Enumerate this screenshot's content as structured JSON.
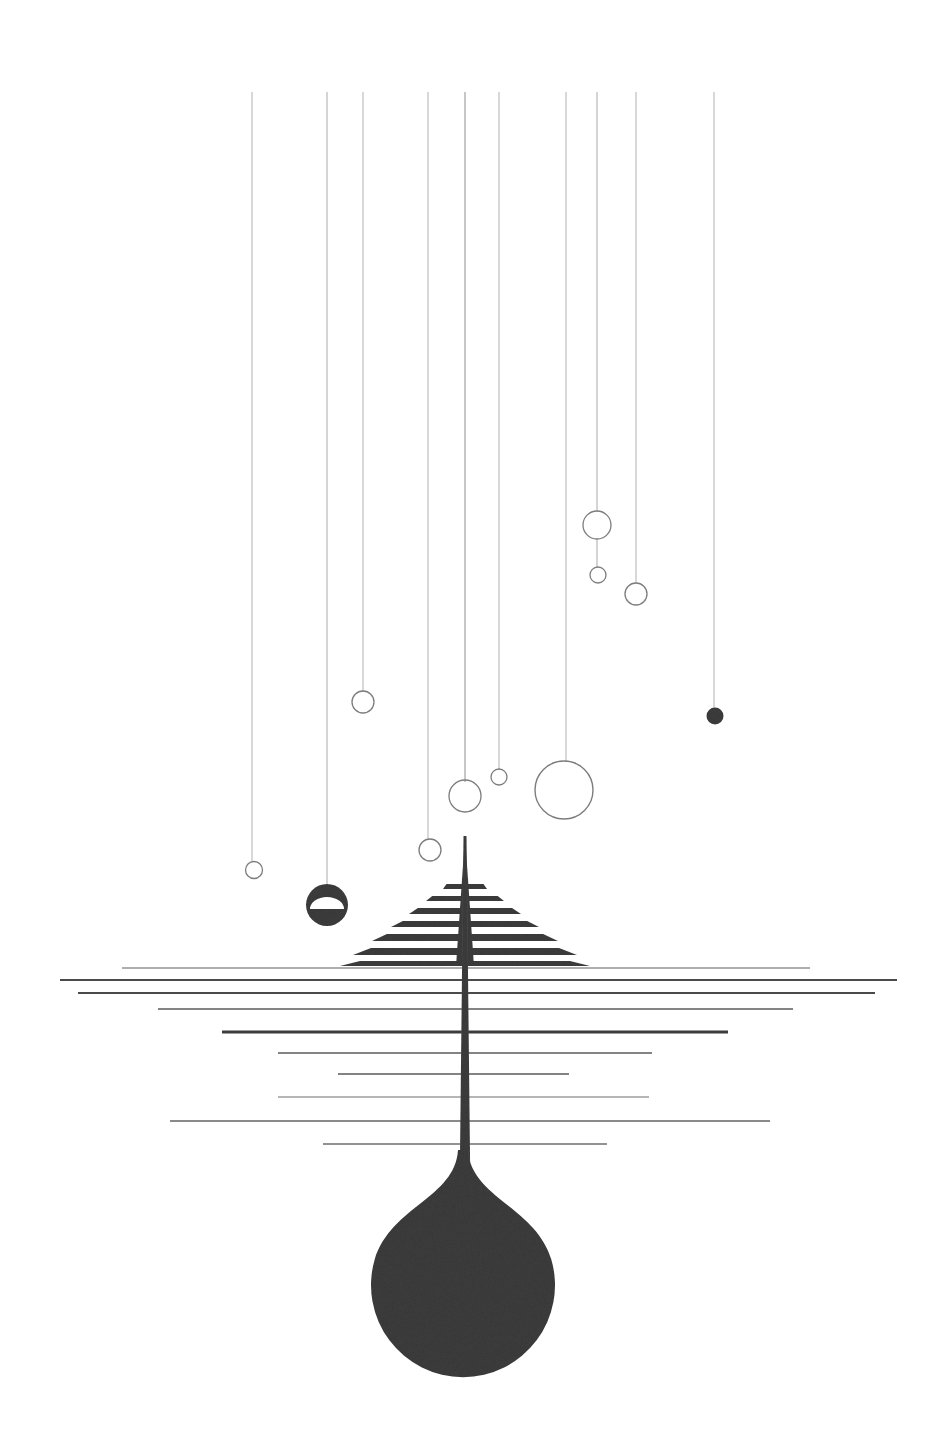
{
  "artwork": {
    "title": "Dandelion Seed / Tree Abstract",
    "canvas": {
      "width": 951,
      "height": 1442,
      "background": "#ffffff"
    },
    "palette": {
      "ink_dark": "#3c3c3c",
      "ink_mid": "#555555",
      "hairline": "#9a9a9a",
      "hairline_faint": "#b4b4b4",
      "background": "#ffffff"
    },
    "caption": "Abstract ink illustration: ten vertical hairlines descend from the top edge, several terminating in small open circles; a striped triangular canopy and a long tapering stem cross a field of horizontal rules and swell into a large filled droplet at the bottom."
  },
  "vertical_threads": [
    {
      "name": "thread-1",
      "x": 252,
      "y_top": 92,
      "y_bottom": 862,
      "width": 0.9,
      "color": "#a8a8a8"
    },
    {
      "name": "thread-2",
      "x": 327,
      "y_top": 92,
      "y_bottom": 884,
      "width": 0.9,
      "color": "#a0a0a0"
    },
    {
      "name": "thread-3",
      "x": 363,
      "y_top": 92,
      "y_bottom": 692,
      "width": 0.9,
      "color": "#a8a8a8"
    },
    {
      "name": "thread-4",
      "x": 428,
      "y_top": 92,
      "y_bottom": 840,
      "width": 0.9,
      "color": "#a8a8a8"
    },
    {
      "name": "thread-5",
      "x": 465,
      "y_top": 92,
      "y_bottom": 782,
      "width": 1.0,
      "color": "#8e8e8e"
    },
    {
      "name": "thread-6",
      "x": 499,
      "y_top": 92,
      "y_bottom": 770,
      "width": 0.9,
      "color": "#a8a8a8"
    },
    {
      "name": "thread-7",
      "x": 566,
      "y_top": 92,
      "y_bottom": 762,
      "width": 0.9,
      "color": "#a8a8a8"
    },
    {
      "name": "thread-8",
      "x": 597,
      "y_top": 92,
      "y_bottom": 512,
      "width": 0.9,
      "color": "#a0a0a0"
    },
    {
      "name": "thread-9",
      "x": 636,
      "y_top": 92,
      "y_bottom": 583,
      "width": 0.9,
      "color": "#a8a8a8"
    },
    {
      "name": "thread-10",
      "x": 714,
      "y_top": 92,
      "y_bottom": 709,
      "width": 0.9,
      "color": "#a8a8a8"
    }
  ],
  "thread_links": [
    {
      "name": "link-8-mid",
      "x": 597,
      "y_top": 539,
      "y_bottom": 567,
      "color": "#a0a0a0"
    }
  ],
  "open_circles": [
    {
      "name": "circle-upper-right-large",
      "cx": 597,
      "cy": 525,
      "r": 14.0,
      "stroke": "#7d7d7d",
      "stroke_width": 1.3
    },
    {
      "name": "circle-upper-right-tiny",
      "cx": 598,
      "cy": 575,
      "r": 8.0,
      "stroke": "#7d7d7d",
      "stroke_width": 1.3
    },
    {
      "name": "circle-upper-far-right",
      "cx": 636,
      "cy": 594,
      "r": 11.0,
      "stroke": "#7d7d7d",
      "stroke_width": 1.3
    },
    {
      "name": "circle-mid-left",
      "cx": 363,
      "cy": 702,
      "r": 11.0,
      "stroke": "#7d7d7d",
      "stroke_width": 1.3
    },
    {
      "name": "circle-center-medium",
      "cx": 465,
      "cy": 796,
      "r": 16.0,
      "stroke": "#7d7d7d",
      "stroke_width": 1.3
    },
    {
      "name": "circle-center-tiny",
      "cx": 499,
      "cy": 777,
      "r": 8.0,
      "stroke": "#7d7d7d",
      "stroke_width": 1.3
    },
    {
      "name": "circle-center-largest",
      "cx": 564,
      "cy": 790,
      "r": 29.0,
      "stroke": "#7d7d7d",
      "stroke_width": 1.4
    },
    {
      "name": "circle-lower-center",
      "cx": 430,
      "cy": 850,
      "r": 11.0,
      "stroke": "#7d7d7d",
      "stroke_width": 1.3
    },
    {
      "name": "circle-lower-left-small",
      "cx": 254,
      "cy": 870,
      "r": 8.5,
      "stroke": "#7d7d7d",
      "stroke_width": 1.3
    }
  ],
  "filled_circles": [
    {
      "name": "dot-far-right-filled",
      "cx": 715,
      "cy": 716,
      "r": 8.5,
      "fill": "#3c3c3c"
    },
    {
      "name": "ball-half-filled",
      "cx": 327,
      "cy": 905,
      "r": 21.0,
      "fill": "#3c3c3c",
      "notch": {
        "cy_offset": 4,
        "rx": 17,
        "ry": 12
      }
    }
  ],
  "canopy": {
    "name": "striped-triangular-canopy",
    "apex_x": 465,
    "apex_y": 836,
    "base_y": 966,
    "fill": "#3c3c3c",
    "bars": [
      {
        "y": 884,
        "half_width": 22,
        "height": 5
      },
      {
        "y": 896,
        "half_width": 39,
        "height": 5
      },
      {
        "y": 908,
        "half_width": 56,
        "height": 6
      },
      {
        "y": 921,
        "half_width": 74,
        "height": 6
      },
      {
        "y": 934,
        "half_width": 93,
        "height": 7
      },
      {
        "y": 948,
        "half_width": 112,
        "height": 7
      },
      {
        "y": 961,
        "half_width": 125,
        "height": 5
      }
    ]
  },
  "horizontal_rules": [
    {
      "name": "rule-1",
      "y": 968,
      "x1": 122,
      "x2": 810,
      "thickness": 1.2,
      "color": "#5f5f5f"
    },
    {
      "name": "rule-2",
      "y": 980,
      "x1": 60,
      "x2": 897,
      "thickness": 2.0,
      "color": "#4a4a4a"
    },
    {
      "name": "rule-3",
      "y": 993,
      "x1": 78,
      "x2": 875,
      "thickness": 1.8,
      "color": "#4a4a4a"
    },
    {
      "name": "rule-4",
      "y": 1009,
      "x1": 158,
      "x2": 793,
      "thickness": 1.4,
      "color": "#5a5a5a"
    },
    {
      "name": "rule-5",
      "y": 1032,
      "x1": 222,
      "x2": 728,
      "thickness": 3.0,
      "color": "#3c3c3c"
    },
    {
      "name": "rule-6",
      "y": 1053,
      "x1": 278,
      "x2": 652,
      "thickness": 1.6,
      "color": "#5a5a5a"
    },
    {
      "name": "rule-7",
      "y": 1074,
      "x1": 338,
      "x2": 569,
      "thickness": 1.6,
      "color": "#5a5a5a"
    },
    {
      "name": "rule-8",
      "y": 1097,
      "x1": 278,
      "x2": 649,
      "thickness": 1.1,
      "color": "#6e6e6e"
    },
    {
      "name": "rule-9",
      "y": 1121,
      "x1": 170,
      "x2": 770,
      "thickness": 1.3,
      "color": "#636363"
    },
    {
      "name": "rule-10",
      "y": 1144,
      "x1": 323,
      "x2": 607,
      "thickness": 1.3,
      "color": "#6e6e6e"
    }
  ],
  "stem": {
    "name": "tapering-stem",
    "x": 465,
    "y_top": 836,
    "y_bottom": 1200,
    "width_top": 3.0,
    "width_bottom": 11.0,
    "fill": "#3c3c3c"
  },
  "droplet": {
    "name": "droplet-bulb",
    "cx": 463,
    "cy": 1287,
    "r": 92,
    "neck_y": 1150,
    "fill": "#3c3c3c"
  }
}
